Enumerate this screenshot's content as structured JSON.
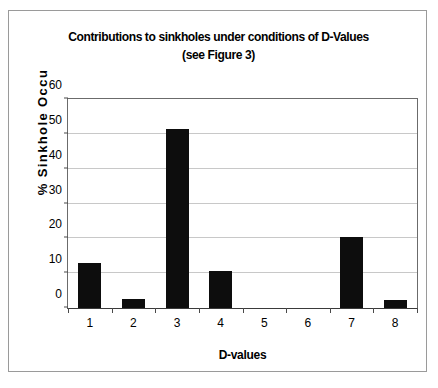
{
  "chart_data": {
    "type": "bar",
    "title": "Contributions to sinkholes under conditions of D-Values (see Figure 3)",
    "title_lines": [
      "Contributions to sinkholes under conditions of D-Values",
      "(see Figure 3)"
    ],
    "xlabel": "D-values",
    "ylabel": "% Sinkhole Occu",
    "categories": [
      "1",
      "2",
      "3",
      "4",
      "5",
      "6",
      "7",
      "8"
    ],
    "values": [
      13.0,
      2.5,
      51.5,
      10.5,
      0,
      0,
      20.5,
      2.3
    ],
    "ylim": [
      0,
      60
    ],
    "ytick_labels": [
      "0",
      "10",
      "20",
      "30",
      "40",
      "50",
      "60"
    ],
    "ytick_values": [
      0,
      10,
      20,
      30,
      40,
      50,
      60
    ],
    "grid": "horizontal",
    "legend": "none",
    "bar_color": "#0d0d0d",
    "gridline_color": "#c8c8c8",
    "background_color": "#ffffff",
    "border_color": "#9a9a9a"
  }
}
